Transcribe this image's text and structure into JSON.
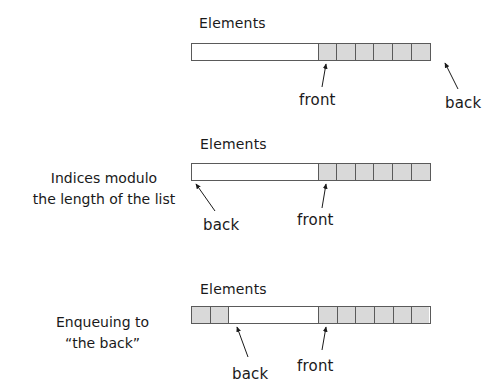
{
  "colors": {
    "filled_cell": "#d9d9d9",
    "border": "#5a5a5a",
    "ink": "#1a1a1a"
  },
  "panels": [
    {
      "heading": "Elements",
      "side_label": [],
      "cells": [
        "empty:126",
        "filled",
        "filled",
        "filled",
        "filled",
        "filled",
        "filled"
      ],
      "pointers": [
        {
          "label": "front",
          "tip": [
            326,
            63
          ],
          "tail": [
            322,
            87
          ],
          "text_pos": [
            300,
            93
          ]
        },
        {
          "label": "back",
          "tip": [
            444,
            62
          ],
          "tail": [
            458,
            90
          ],
          "text_pos": [
            445,
            96
          ]
        }
      ]
    },
    {
      "heading": "Elements",
      "side_label": [
        "Indices modulo",
        "the length of the list"
      ],
      "cells": [
        "empty:126",
        "filled",
        "filled",
        "filled",
        "filled",
        "filled",
        "filled"
      ],
      "pointers": [
        {
          "label": "back",
          "tip": [
            195,
            183
          ],
          "tail": [
            215,
            212
          ],
          "text_pos": [
            203,
            217
          ]
        },
        {
          "label": "front",
          "tip": [
            326,
            183
          ],
          "tail": [
            322,
            208
          ],
          "text_pos": [
            299,
            213
          ]
        }
      ]
    },
    {
      "heading": "Elements",
      "side_label": [
        "Enqueuing to",
        "“the back”"
      ],
      "cells": [
        "filled",
        "filled",
        "empty:90",
        "filled",
        "filled",
        "filled",
        "filled",
        "filled",
        "filled"
      ],
      "pointers": [
        {
          "label": "back",
          "tip": [
            236,
            327
          ],
          "tail": [
            248,
            358
          ],
          "text_pos": [
            233,
            366
          ]
        },
        {
          "label": "front",
          "tip": [
            326,
            326
          ],
          "tail": [
            322,
            351
          ],
          "text_pos": [
            299,
            358
          ]
        }
      ]
    }
  ]
}
